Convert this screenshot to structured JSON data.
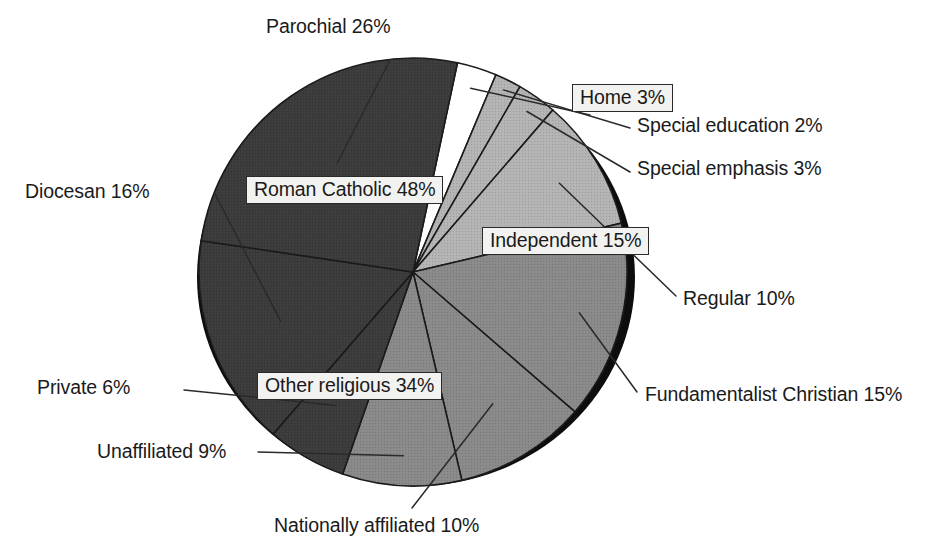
{
  "chart_data": {
    "type": "pie",
    "title": "",
    "subtitle": "",
    "xlabel": "",
    "ylabel": "",
    "units": "percent",
    "legend_position": "callout-labels",
    "grid": false,
    "total": 100,
    "groups": [
      {
        "name": "Roman Catholic",
        "value": 48,
        "label": "Roman Catholic 48%",
        "boxed": true,
        "fill": "#3b3b3b",
        "slices": [
          {
            "name": "Parochial",
            "value": 26,
            "label": "Parochial 26%",
            "boxed": false,
            "fill": "#3b3b3b"
          },
          {
            "name": "Diocesan",
            "value": 16,
            "label": "Diocesan 16%",
            "boxed": false,
            "fill": "#3b3b3b"
          },
          {
            "name": "Private",
            "value": 6,
            "label": "Private 6%",
            "boxed": false,
            "fill": "#3b3b3b"
          }
        ]
      },
      {
        "name": "Other religious",
        "value": 34,
        "label": "Other religious 34%",
        "boxed": true,
        "fill": "#8a8a8a",
        "slices": [
          {
            "name": "Unaffiliated",
            "value": 9,
            "label": "Unaffiliated 9%",
            "boxed": false,
            "fill": "#8a8a8a"
          },
          {
            "name": "Nationally affiliated",
            "value": 10,
            "label": "Nationally affiliated 10%",
            "boxed": false,
            "fill": "#8a8a8a"
          },
          {
            "name": "Fundamentalist Christian",
            "value": 15,
            "label": "Fundamentalist Christian 15%",
            "boxed": false,
            "fill": "#8a8a8a"
          }
        ]
      },
      {
        "name": "Independent",
        "value": 15,
        "label": "Independent 15%",
        "boxed": true,
        "fill": "#b4b4b4",
        "slices": [
          {
            "name": "Regular",
            "value": 10,
            "label": "Regular 10%",
            "boxed": false,
            "fill": "#b4b4b4"
          },
          {
            "name": "Special emphasis",
            "value": 3,
            "label": "Special emphasis 3%",
            "boxed": false,
            "fill": "#b4b4b4"
          },
          {
            "name": "Special education",
            "value": 2,
            "label": "Special education 2%",
            "boxed": false,
            "fill": "#b4b4b4"
          },
          {
            "name": "Home",
            "value": 3,
            "label": "Home 3%",
            "boxed": true,
            "fill": "#ffffff"
          }
        ]
      }
    ],
    "categories": [
      "Parochial",
      "Diocesan",
      "Private",
      "Unaffiliated",
      "Nationally affiliated",
      "Fundamentalist Christian",
      "Regular",
      "Special emphasis",
      "Special education",
      "Home"
    ],
    "values": [
      26,
      16,
      6,
      9,
      10,
      15,
      10,
      3,
      2,
      3
    ]
  },
  "labels": {
    "parochial": "Parochial 26%",
    "diocesan": "Diocesan 16%",
    "private": "Private 6%",
    "unaffiliated": "Unaffiliated 9%",
    "nationally_affiliated": "Nationally affiliated 10%",
    "fundamentalist_christian": "Fundamentalist Christian 15%",
    "regular": "Regular 10%",
    "special_emphasis": "Special emphasis 3%",
    "special_education": "Special education 2%",
    "home": "Home 3%",
    "roman_catholic": "Roman Catholic 48%",
    "other_religious": "Other religious 34%",
    "independent": "Independent 15%"
  },
  "colors": {
    "roman_catholic": "#3b3b3b",
    "other_religious": "#8a8a8a",
    "independent": "#b4b4b4",
    "home": "#ffffff",
    "shadow": "#101010",
    "outline": "#1a1a1a",
    "background": "#ffffff",
    "label_box_fill": "#f2f2f0"
  }
}
